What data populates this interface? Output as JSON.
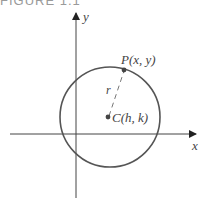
{
  "figure": {
    "caption": "FIGURE 1.1",
    "axes": {
      "x_label": "x",
      "y_label": "y"
    },
    "point_label": "P(x, y)",
    "center_label": "C(h, k)",
    "radius_label": "r",
    "colors": {
      "stroke": "#333333",
      "circle": "#555555",
      "label": "#444444"
    }
  }
}
